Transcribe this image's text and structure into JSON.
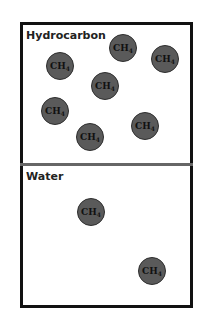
{
  "regions": [
    {
      "label": "Hydrocarbon"
    },
    {
      "label": "Water"
    }
  ],
  "molecule": {
    "formula": "CH",
    "subscript": "4",
    "fill": "#5a5a5a"
  },
  "molecules": [
    {
      "region": "Hydrocarbon",
      "x": 123,
      "y": 48
    },
    {
      "region": "Hydrocarbon",
      "x": 165,
      "y": 59
    },
    {
      "region": "Hydrocarbon",
      "x": 60,
      "y": 66
    },
    {
      "region": "Hydrocarbon",
      "x": 105,
      "y": 86
    },
    {
      "region": "Hydrocarbon",
      "x": 55,
      "y": 111
    },
    {
      "region": "Hydrocarbon",
      "x": 90,
      "y": 137
    },
    {
      "region": "Hydrocarbon",
      "x": 145,
      "y": 126
    },
    {
      "region": "Water",
      "x": 91,
      "y": 212
    },
    {
      "region": "Water",
      "x": 152,
      "y": 271
    }
  ]
}
